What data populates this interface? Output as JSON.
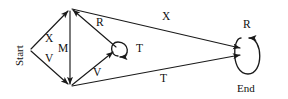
{
  "diagram": {
    "type": "state-transition-diagram",
    "title": "",
    "stroke_color": "#1a1a1a",
    "background_color": "#ffffff",
    "nodes": [
      {
        "id": "start",
        "label": "Start",
        "x": 30,
        "y": 50,
        "rotated": true,
        "self_loop": false
      },
      {
        "id": "top",
        "label": "",
        "x": 70,
        "y": 9,
        "rotated": false,
        "self_loop": false
      },
      {
        "id": "bottom",
        "label": "",
        "x": 70,
        "y": 86,
        "rotated": false,
        "self_loop": false
      },
      {
        "id": "middle",
        "label": "",
        "x": 119,
        "y": 50,
        "rotated": false,
        "self_loop": true,
        "loop_label": "T"
      },
      {
        "id": "end",
        "label": "End",
        "x": 247,
        "y": 52,
        "rotated": false,
        "self_loop": true,
        "loop_label": "R"
      }
    ],
    "edge_labels": [
      {
        "name": "edge-label-x-start-top",
        "text": "X",
        "x": 45,
        "y": 33
      },
      {
        "name": "edge-label-v-start-bottom",
        "text": "V",
        "x": 45,
        "y": 53
      },
      {
        "name": "edge-label-m-top-bottom",
        "text": "M",
        "x": 59,
        "y": 42
      },
      {
        "name": "edge-label-r-middle-top",
        "text": "R",
        "x": 96,
        "y": 17
      },
      {
        "name": "edge-label-v-bottom-middle",
        "text": "V",
        "x": 93,
        "y": 67
      },
      {
        "name": "edge-label-t-middle-loop",
        "text": "T",
        "x": 136,
        "y": 43
      },
      {
        "name": "edge-label-x-top-end",
        "text": "X",
        "x": 162,
        "y": 11
      },
      {
        "name": "edge-label-t-bottom-end",
        "text": "T",
        "x": 160,
        "y": 73
      },
      {
        "name": "edge-label-r-end-loop",
        "text": "R",
        "x": 243,
        "y": 19
      }
    ],
    "node_labels": [
      {
        "name": "node-label-start",
        "text": "Start",
        "x": 14,
        "y": 66
      },
      {
        "name": "node-label-end",
        "text": "End",
        "x": 237,
        "y": 83
      }
    ]
  }
}
